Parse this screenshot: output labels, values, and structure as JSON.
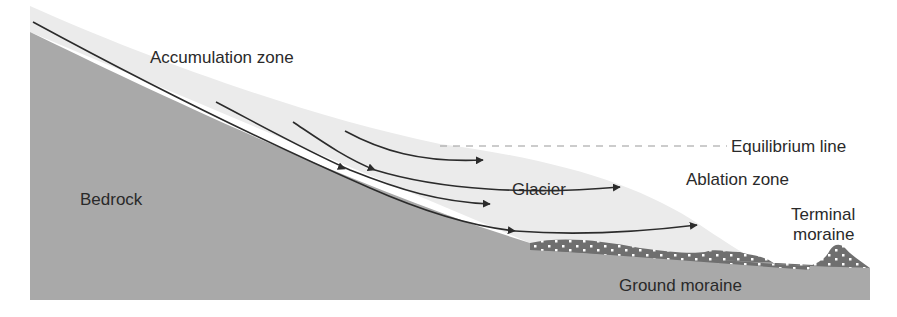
{
  "diagram": {
    "type": "glacier-cross-section",
    "colors": {
      "background": "#ffffff",
      "bedrock": "#a9a9a9",
      "glacier_ice": "#ebebeb",
      "moraine": "#6f6f6f",
      "moraine_clasts": "#ffffff",
      "flow_lines": "#2b2b2b",
      "equilibrium_line": "#9a9a9a",
      "text": "#2a2a2a"
    },
    "labels": {
      "accumulation_zone": "Accumulation zone",
      "equilibrium_line": "Equilibrium line",
      "ablation_zone": "Ablation zone",
      "glacier": "Glacier",
      "bedrock": "Bedrock",
      "terminal_moraine_line1": "Terminal",
      "terminal_moraine_line2": "moraine",
      "ground_moraine": "Ground moraine"
    },
    "flow_lines": [
      {
        "id": "flow-1",
        "description": "longest basal flow line, arrows mid-way and at terminus"
      },
      {
        "id": "flow-2",
        "description": "second flow line"
      },
      {
        "id": "flow-3",
        "description": "third flow line rising toward surface"
      },
      {
        "id": "flow-4",
        "description": "shortest near-surface flow line"
      }
    ]
  }
}
